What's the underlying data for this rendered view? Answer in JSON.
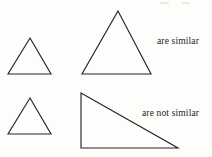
{
  "figure": {
    "background_color": "#fdfdfc",
    "stroke_color": "#262626",
    "captions": {
      "similar": "are similar",
      "not_similar": "are not similar"
    },
    "rows": [
      {
        "name": "similar-row",
        "caption": "are similar",
        "shapes": [
          {
            "name": "small-equilateral-triangle",
            "kind": "triangle",
            "points": "30,38 51,74 8,74"
          },
          {
            "name": "large-equilateral-triangle",
            "kind": "triangle",
            "points": "118,11 151,74 82,74"
          }
        ]
      },
      {
        "name": "not-similar-row",
        "caption": "are not similar",
        "shapes": [
          {
            "name": "small-equilateral-triangle-2",
            "kind": "triangle",
            "points": "30,98 51,134 8,134"
          },
          {
            "name": "right-scalene-triangle",
            "kind": "triangle",
            "points": "81,93 178,148 81,148"
          }
        ]
      }
    ]
  }
}
